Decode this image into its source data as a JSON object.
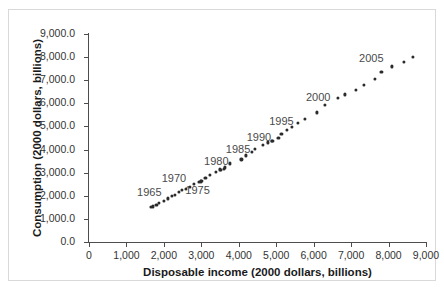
{
  "chart_data": {
    "type": "scatter",
    "title": "",
    "xlabel": "Disposable income (2000 dollars, billions)",
    "ylabel": "Consumption (2000 dollars, billions)",
    "xlim": [
      0,
      9000
    ],
    "ylim": [
      0,
      9000
    ],
    "grid": false,
    "legend": null,
    "xticks": [
      0,
      1000,
      2000,
      3000,
      4000,
      5000,
      6000,
      7000,
      8000,
      9000
    ],
    "xtick_labels": [
      "0",
      "1,000",
      "2,000",
      "3,000",
      "4,000",
      "5,000",
      "6,000",
      "7,000",
      "8,000",
      "9,000"
    ],
    "yticks": [
      0,
      1000,
      2000,
      3000,
      4000,
      5000,
      6000,
      7000,
      8000,
      9000
    ],
    "ytick_labels": [
      "0.0",
      "1,000.0",
      "2,000.0",
      "3,000.0",
      "4,000.0",
      "5,000.0",
      "6,000.0",
      "7,000.0",
      "8,000.0",
      "9,000.0"
    ],
    "marker": "filled-circle",
    "marker_color": "#2b2b2b",
    "points": [
      {
        "year": 1960,
        "x": 1660,
        "y": 1510
      },
      {
        "year": 1961,
        "x": 1710,
        "y": 1540
      },
      {
        "year": 1962,
        "x": 1800,
        "y": 1610
      },
      {
        "year": 1963,
        "x": 1870,
        "y": 1680
      },
      {
        "year": 1964,
        "x": 1990,
        "y": 1780
      },
      {
        "year": 1965,
        "x": 2110,
        "y": 1890
      },
      {
        "year": 1966,
        "x": 2210,
        "y": 1990
      },
      {
        "year": 1967,
        "x": 2300,
        "y": 2040
      },
      {
        "year": 1968,
        "x": 2400,
        "y": 2160
      },
      {
        "year": 1969,
        "x": 2480,
        "y": 2240
      },
      {
        "year": 1970,
        "x": 2590,
        "y": 2290
      },
      {
        "year": 1971,
        "x": 2690,
        "y": 2370
      },
      {
        "year": 1972,
        "x": 2800,
        "y": 2520
      },
      {
        "year": 1973,
        "x": 2980,
        "y": 2620
      },
      {
        "year": 1974,
        "x": 2940,
        "y": 2590
      },
      {
        "year": 1975,
        "x": 3000,
        "y": 2640
      },
      {
        "year": 1976,
        "x": 3110,
        "y": 2790
      },
      {
        "year": 1977,
        "x": 3220,
        "y": 2910
      },
      {
        "year": 1978,
        "x": 3390,
        "y": 3050
      },
      {
        "year": 1979,
        "x": 3490,
        "y": 3140
      },
      {
        "year": 1980,
        "x": 3520,
        "y": 3130
      },
      {
        "year": 1981,
        "x": 3600,
        "y": 3170
      },
      {
        "year": 1982,
        "x": 3640,
        "y": 3230
      },
      {
        "year": 1983,
        "x": 3770,
        "y": 3400
      },
      {
        "year": 1984,
        "x": 4070,
        "y": 3570
      },
      {
        "year": 1985,
        "x": 4190,
        "y": 3750
      },
      {
        "year": 1986,
        "x": 4340,
        "y": 3910
      },
      {
        "year": 1987,
        "x": 4430,
        "y": 4030
      },
      {
        "year": 1988,
        "x": 4640,
        "y": 4200
      },
      {
        "year": 1989,
        "x": 4780,
        "y": 4310
      },
      {
        "year": 1990,
        "x": 4880,
        "y": 4390
      },
      {
        "year": 1991,
        "x": 4900,
        "y": 4380
      },
      {
        "year": 1992,
        "x": 5060,
        "y": 4500
      },
      {
        "year": 1993,
        "x": 5140,
        "y": 4660
      },
      {
        "year": 1994,
        "x": 5280,
        "y": 4840
      },
      {
        "year": 1995,
        "x": 5420,
        "y": 4990
      },
      {
        "year": 1996,
        "x": 5570,
        "y": 5160
      },
      {
        "year": 1997,
        "x": 5760,
        "y": 5340
      },
      {
        "year": 1998,
        "x": 6090,
        "y": 5610
      },
      {
        "year": 1999,
        "x": 6290,
        "y": 5930
      },
      {
        "year": 2000,
        "x": 6640,
        "y": 6240
      },
      {
        "year": 2001,
        "x": 6830,
        "y": 6390
      },
      {
        "year": 2002,
        "x": 7120,
        "y": 6580
      },
      {
        "year": 2003,
        "x": 7350,
        "y": 6810
      },
      {
        "year": 2004,
        "x": 7640,
        "y": 7060
      },
      {
        "year": 2005,
        "x": 7810,
        "y": 7350
      },
      {
        "year": 2006,
        "x": 8090,
        "y": 7600
      },
      {
        "year": 2007,
        "x": 8400,
        "y": 7790
      },
      {
        "year": 2008,
        "x": 8650,
        "y": 8000
      }
    ],
    "annotations": [
      {
        "text": "1965",
        "x": 1610,
        "y": 2150
      },
      {
        "text": "1970",
        "x": 2270,
        "y": 2760
      },
      {
        "text": "1975",
        "x": 2900,
        "y": 2250
      },
      {
        "text": "1980",
        "x": 3400,
        "y": 3520
      },
      {
        "text": "1985",
        "x": 3980,
        "y": 4040
      },
      {
        "text": "1990",
        "x": 4540,
        "y": 4560
      },
      {
        "text": "1995",
        "x": 5140,
        "y": 5230
      },
      {
        "text": "2000",
        "x": 6120,
        "y": 6270
      },
      {
        "text": "2005",
        "x": 7540,
        "y": 7960
      }
    ]
  }
}
